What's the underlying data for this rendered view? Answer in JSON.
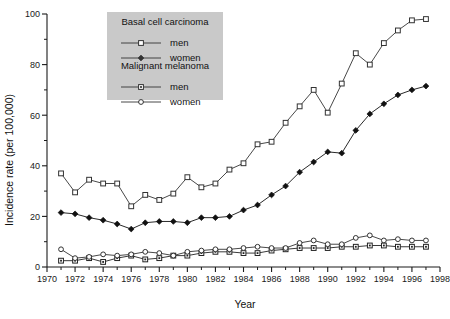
{
  "chart_data": {
    "type": "line",
    "title": "",
    "xlabel": "Year",
    "ylabel": "Incidence rate (per 100,000)",
    "xlim": [
      1970,
      1998
    ],
    "ylim": [
      0,
      100
    ],
    "xticks": [
      1970,
      1972,
      1974,
      1976,
      1978,
      1980,
      1982,
      1984,
      1986,
      1988,
      1990,
      1992,
      1994,
      1996,
      1998
    ],
    "xtick_labels": [
      "1970",
      "1972",
      "1974",
      "1976",
      "1978",
      "1980",
      "1982",
      "1984",
      "1986",
      "1988",
      "1990",
      "1992",
      "1994",
      "1996",
      "1998"
    ],
    "xminor_step": 1,
    "yticks": [
      0,
      20,
      40,
      60,
      80,
      100
    ],
    "ytick_labels": [
      "0",
      "20",
      "40",
      "60",
      "80",
      "100"
    ],
    "yminor_step": 10,
    "grid": false,
    "legend_position": "top-center",
    "x": [
      1971,
      1972,
      1973,
      1974,
      1975,
      1976,
      1977,
      1978,
      1979,
      1980,
      1981,
      1982,
      1983,
      1984,
      1985,
      1986,
      1987,
      1988,
      1989,
      1990,
      1991,
      1992,
      1993,
      1994,
      1995,
      1996,
      1997
    ],
    "series": [
      {
        "name": "Basal cell carcinoma men",
        "group": "Basal cell carcinoma",
        "label": "men",
        "marker": "open-square",
        "color": "#333333",
        "values": [
          37.0,
          29.5,
          34.5,
          33.0,
          33.0,
          24.0,
          28.5,
          26.5,
          29.0,
          35.5,
          31.5,
          33.0,
          38.5,
          41.0,
          48.5,
          49.5,
          57.0,
          63.5,
          70.0,
          61.0,
          72.5,
          84.5,
          80.0,
          88.5,
          93.5,
          97.5,
          98.0
        ]
      },
      {
        "name": "Basal cell carcinoma women",
        "group": "Basal cell carcinoma",
        "label": "women",
        "marker": "filled-diamond",
        "color": "#111111",
        "values": [
          21.5,
          21.0,
          19.5,
          18.5,
          17.0,
          15.0,
          17.5,
          18.0,
          18.0,
          17.5,
          19.5,
          19.5,
          20.0,
          22.5,
          24.5,
          28.5,
          32.0,
          37.5,
          41.5,
          45.5,
          45.0,
          54.0,
          60.5,
          64.5,
          68.0,
          70.0,
          71.5
        ]
      },
      {
        "name": "Malignant melanoma men",
        "group": "Malignant melanoma",
        "label": "men",
        "marker": "dotted-square",
        "color": "#222222",
        "values": [
          2.5,
          2.5,
          3.5,
          2.0,
          3.5,
          4.5,
          3.0,
          3.5,
          4.5,
          4.5,
          5.5,
          6.0,
          6.0,
          5.5,
          5.5,
          6.5,
          7.0,
          7.5,
          7.5,
          7.5,
          8.0,
          8.0,
          8.5,
          8.5,
          8.0,
          8.0,
          8.0
        ]
      },
      {
        "name": "Malignant melanoma women",
        "group": "Malignant melanoma",
        "label": "women",
        "marker": "open-circle",
        "color": "#333333",
        "values": [
          7.0,
          3.5,
          4.0,
          5.0,
          4.5,
          5.0,
          6.0,
          5.5,
          4.5,
          6.0,
          6.5,
          7.0,
          7.0,
          7.5,
          8.0,
          7.5,
          7.5,
          9.5,
          10.5,
          9.0,
          9.0,
          11.5,
          12.5,
          10.5,
          11.0,
          10.5,
          10.5
        ]
      }
    ],
    "legend": {
      "groups": [
        {
          "title": "Basal cell carcinoma",
          "entries": [
            {
              "label": "men",
              "marker": "open-square"
            },
            {
              "label": "women",
              "marker": "filled-diamond"
            }
          ]
        },
        {
          "title": "Malignant melanoma",
          "entries": [
            {
              "label": "men",
              "marker": "dotted-square"
            },
            {
              "label": "women",
              "marker": "open-circle"
            }
          ]
        }
      ],
      "background_color": "#c9c9c9"
    },
    "colors": {
      "axis": "#1a1a1a",
      "line": "#3a3a3a",
      "background": "#ffffff"
    }
  }
}
